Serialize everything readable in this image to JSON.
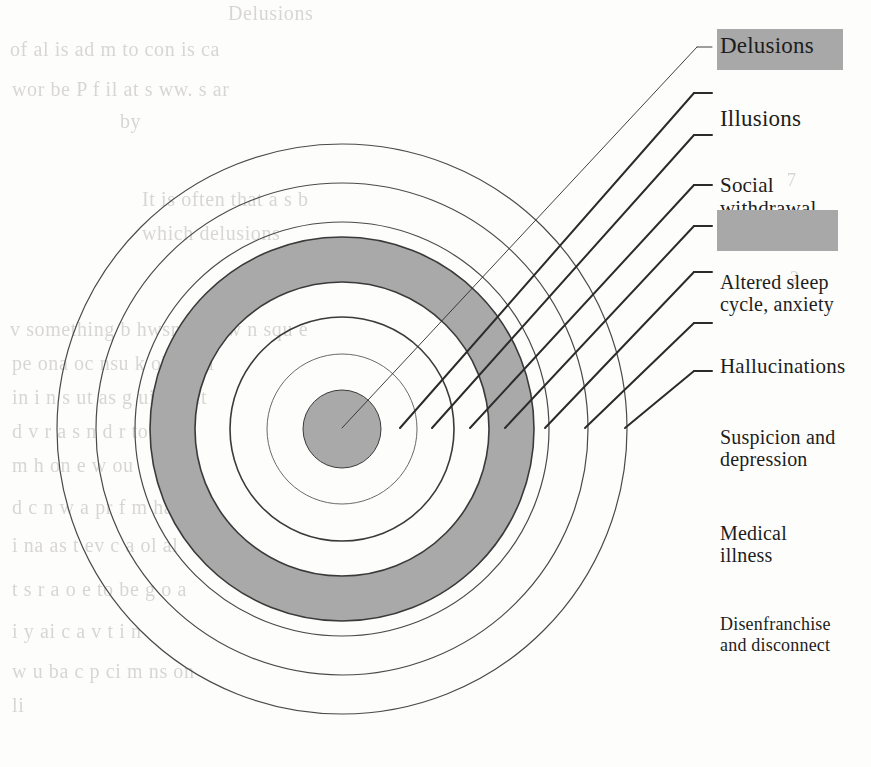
{
  "page": {
    "kind": "book-figure-scan",
    "background_color": "#fdfdfb",
    "ink_color": "#1d1d1d",
    "highlight_color": "#a8a8a8",
    "ring_fill_gray": "#a9a9a9"
  },
  "diagram": {
    "title": "",
    "center": {
      "x": 342,
      "y": 429
    },
    "rings": [
      {
        "name": "core-disc",
        "radius": 39,
        "fill": "#a9a9a9",
        "stroke": "#3a3a3a",
        "stroke_width": 1.0
      },
      {
        "name": "ring-2",
        "radius": 75,
        "fill": "none",
        "stroke": "#6a6a6a",
        "stroke_width": 1.0
      },
      {
        "name": "ring-3",
        "radius": 112,
        "fill": "none",
        "stroke": "#3a3a3a",
        "stroke_width": 1.6
      },
      {
        "name": "ring-4-gray-band",
        "radius": 147,
        "fill": "none",
        "stroke": "#3a3a3a",
        "stroke_width": 1.6
      },
      {
        "name": "ring-5",
        "radius": 192,
        "fill": "none",
        "stroke": "#3a3a3a",
        "stroke_width": 1.6
      },
      {
        "name": "ring-6",
        "radius": 207,
        "fill": "none",
        "stroke": "#4a4a4a",
        "stroke_width": 1.2
      },
      {
        "name": "ring-7",
        "radius": 246,
        "fill": "none",
        "stroke": "#4a4a4a",
        "stroke_width": 1.2
      },
      {
        "name": "ring-8",
        "radius": 285,
        "fill": "none",
        "stroke": "#4a4a4a",
        "stroke_width": 1.2
      }
    ],
    "gray_band": {
      "inner_radius": 147,
      "outer_radius": 192,
      "color": "#a9a9a9"
    }
  },
  "labels": [
    {
      "id": "delusions",
      "text": "Delusions",
      "highlighted": true,
      "font_size": 23,
      "text_x": 720,
      "text_y": 33,
      "box": {
        "x": 717,
        "y": 29,
        "w": 126,
        "h": 41
      },
      "leader": {
        "from_x": 342,
        "from_y": 428,
        "elbow_x": 697,
        "elbow_y": 47,
        "to_x": 712,
        "to_y": 47
      },
      "leader_weight": 0.9
    },
    {
      "id": "illusions",
      "text": "Illusions",
      "highlighted": false,
      "font_size": 23,
      "text_x": 720,
      "text_y": 80,
      "leader": {
        "from_x": 400,
        "from_y": 428,
        "elbow_x": 694,
        "elbow_y": 93,
        "to_x": 712,
        "to_y": 93
      },
      "leader_weight": 2.0
    },
    {
      "id": "social-withdrawal",
      "text": "Social\nwithdrawal",
      "highlighted": false,
      "font_size": 21,
      "text_x": 720,
      "text_y": 122,
      "leader": {
        "from_x": 432,
        "from_y": 428,
        "elbow_x": 694,
        "elbow_y": 135,
        "to_x": 712,
        "to_y": 135
      },
      "leader_weight": 2.0
    },
    {
      "id": "altered-sleep",
      "text": "Altered sleep\ncycle, anxiety",
      "highlighted": false,
      "font_size": 20,
      "text_x": 720,
      "text_y": 172,
      "leader": {
        "from_x": 470,
        "from_y": 428,
        "elbow_x": 694,
        "elbow_y": 185,
        "to_x": 712,
        "to_y": 185
      },
      "leader_weight": 2.0
    },
    {
      "id": "hallucinations",
      "text": "Hallucinations",
      "highlighted": true,
      "font_size": 21,
      "text_x": 720,
      "text_y": 212,
      "box": {
        "x": 717,
        "y": 210,
        "w": 121,
        "h": 41
      },
      "leader": {
        "from_x": 505,
        "from_y": 428,
        "elbow_x": 694,
        "elbow_y": 226,
        "to_x": 712,
        "to_y": 226
      },
      "leader_weight": 2.0
    },
    {
      "id": "suspicion-depression",
      "text": "Suspicion and\n depression",
      "highlighted": false,
      "font_size": 20,
      "text_x": 720,
      "text_y": 259,
      "leader": {
        "from_x": 545,
        "from_y": 428,
        "elbow_x": 694,
        "elbow_y": 272,
        "to_x": 712,
        "to_y": 272
      },
      "leader_weight": 2.0
    },
    {
      "id": "medical-illness",
      "text": "Medical\nillness",
      "highlighted": false,
      "font_size": 20,
      "text_x": 720,
      "text_y": 310,
      "leader": {
        "from_x": 585,
        "from_y": 428,
        "elbow_x": 694,
        "elbow_y": 323,
        "to_x": 712,
        "to_y": 323
      },
      "leader_weight": 2.0
    },
    {
      "id": "disenfranchise-disconnect",
      "text": "Disenfranchise\nand disconnect",
      "highlighted": false,
      "font_size": 18,
      "text_x": 720,
      "text_y": 358,
      "leader": {
        "from_x": 625,
        "from_y": 428,
        "elbow_x": 694,
        "elbow_y": 371,
        "to_x": 712,
        "to_y": 371
      },
      "leader_weight": 2.0
    }
  ],
  "bleed_through": [
    {
      "text": "Delusions",
      "x": 228,
      "y": 2,
      "size": 20
    },
    {
      "text": "of  al   is  ad     m  to con  is  ca",
      "x": 10,
      "y": 38,
      "size": 20
    },
    {
      "text": "wor   be  P  f   il    at  s    ww.    s  ar",
      "x": 12,
      "y": 78,
      "size": 20
    },
    {
      "text": "by",
      "x": 120,
      "y": 110,
      "size": 20
    },
    {
      "text": "It  is  often  that  a  s     b",
      "x": 142,
      "y": 188,
      "size": 20
    },
    {
      "text": "which  delusions",
      "x": 142,
      "y": 222,
      "size": 20
    },
    {
      "text": "v  something  b  hwsn  as  h  w    n   squ  e",
      "x": 10,
      "y": 318,
      "size": 20
    },
    {
      "text": "pe   ona   oc   nsu   k  old   e   al",
      "x": 12,
      "y": 352,
      "size": 20
    },
    {
      "text": "in  i  n  s   ut  as  g   uit  pr  nt",
      "x": 12,
      "y": 386,
      "size": 20
    },
    {
      "text": "d      v     r     a  s     n    d  r    to  d",
      "x": 12,
      "y": 420,
      "size": 20
    },
    {
      "text": "m      h   on     e    w    ou",
      "x": 12,
      "y": 454,
      "size": 20
    },
    {
      "text": "d  c     n    w    a   pr  f   m  ha",
      "x": 12,
      "y": 496,
      "size": 20
    },
    {
      "text": "i    na    as  t   ev  c   a  ol   al",
      "x": 12,
      "y": 534,
      "size": 20
    },
    {
      "text": "t  s  r   a     o  e   to  be   g   o  a",
      "x": 12,
      "y": 578,
      "size": 20
    },
    {
      "text": "i  y    ai      c   a   v   t    i   n",
      "x": 12,
      "y": 620,
      "size": 20
    },
    {
      "text": "w  u   ba    c   p  ci   m  ns  on",
      "x": 12,
      "y": 660,
      "size": 20
    },
    {
      "text": "li",
      "x": 12,
      "y": 694,
      "size": 20
    },
    {
      "text": "7",
      "x": 787,
      "y": 170,
      "size": 18
    },
    {
      "text": "2",
      "x": 790,
      "y": 268,
      "size": 18
    }
  ]
}
